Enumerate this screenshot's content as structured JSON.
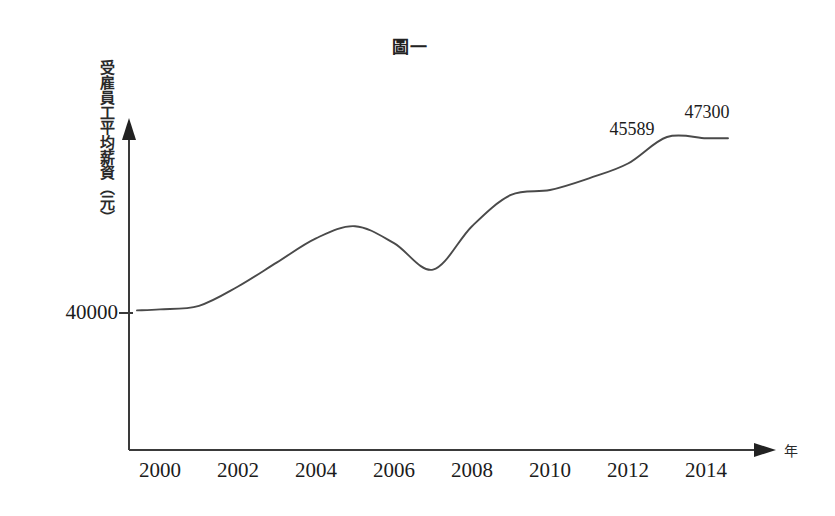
{
  "chart_data": {
    "type": "line",
    "title": "圖一",
    "xlabel": "年",
    "ylabel": "受雇員工平均薪資（元）",
    "grid": false,
    "legend": "none",
    "xlim": [
      1999.4,
      2014.8
    ],
    "ylim": [
      39000,
      48500
    ],
    "xticks": [
      "2000",
      "2002",
      "2004",
      "2006",
      "2008",
      "2010",
      "2012",
      "2014"
    ],
    "xtick_values": [
      2000,
      2002,
      2004,
      2006,
      2008,
      2010,
      2012,
      2014
    ],
    "yticks": [
      "40000"
    ],
    "ytick_values": [
      40000
    ],
    "x": [
      2000,
      2001,
      2002,
      2003,
      2004,
      2005,
      2006,
      2007,
      2008,
      2009,
      2010,
      2011,
      2012,
      2013,
      2014
    ],
    "values": [
      40150,
      40300,
      41100,
      42100,
      43100,
      43600,
      42900,
      41800,
      43600,
      44900,
      45100,
      45589,
      46200,
      47300,
      47250
    ],
    "annotations": [
      {
        "label": "45589",
        "x": 2011.6,
        "y": 45589
      },
      {
        "label": "47300",
        "x": 2013.5,
        "y": 47300
      }
    ]
  },
  "axes": {
    "y_unit_note": "（元）",
    "x_unit": "年",
    "y_value_label": "40000"
  },
  "icons": {
    "y_axis_arrow": "arrow-up-icon",
    "x_axis_arrow": "arrow-right-icon"
  }
}
